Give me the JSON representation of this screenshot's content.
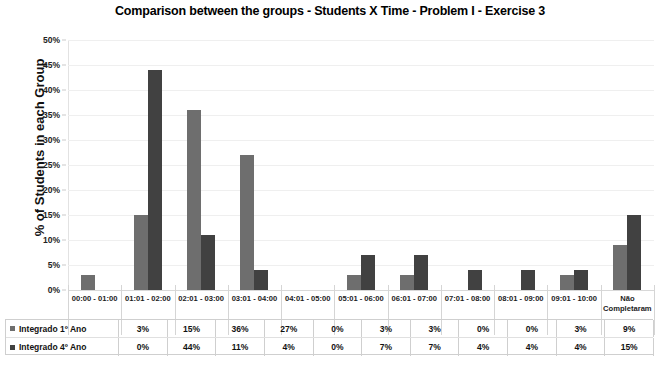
{
  "chart_data": {
    "type": "bar",
    "title": "Comparison between the groups - Students X Time - Problem I - Exercise 3",
    "xlabel": "",
    "ylabel": "% of Students in each Group",
    "ylim": [
      0,
      50
    ],
    "ytick_labels": [
      "0%",
      "5%",
      "10%",
      "15%",
      "20%",
      "25%",
      "30%",
      "35%",
      "40%",
      "45%",
      "50%"
    ],
    "ytick_values": [
      0,
      5,
      10,
      15,
      20,
      25,
      30,
      35,
      40,
      45,
      50
    ],
    "grid": true,
    "legend_position": "table-below",
    "categories": [
      "00:00 - 01:00",
      "01:01 - 02:00",
      "02:01 - 03:00",
      "03:01 - 04:00",
      "04:01 - 05:00",
      "05:01 - 06:00",
      "06:01 - 07:00",
      "07:01 - 08:00",
      "08:01 - 09:00",
      "09:01 - 10:00",
      "Não Completaram"
    ],
    "series": [
      {
        "name": "Integrado 1º Ano",
        "color": "#6e6e6e",
        "values": [
          3,
          15,
          36,
          27,
          0,
          3,
          3,
          0,
          0,
          3,
          9
        ],
        "labels": [
          "3%",
          "15%",
          "36%",
          "27%",
          "0%",
          "3%",
          "3%",
          "0%",
          "0%",
          "3%",
          "9%"
        ]
      },
      {
        "name": "Integrado 4º Ano",
        "color": "#414141",
        "values": [
          0,
          44,
          11,
          4,
          0,
          7,
          7,
          4,
          4,
          4,
          15
        ],
        "labels": [
          "0%",
          "44%",
          "11%",
          "4%",
          "0%",
          "7%",
          "7%",
          "4%",
          "4%",
          "4%",
          "15%"
        ]
      }
    ]
  }
}
